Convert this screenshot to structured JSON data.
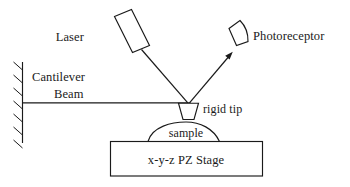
{
  "diagram": {
    "background_color": "#ffffff",
    "line_color": "#1a1a1a",
    "labels": {
      "laser": "Laser",
      "photoreceptor": "Photoreceptor",
      "cantilever_line1": "Cantilever",
      "cantilever_line2": "Beam",
      "rigid_tip": "rigid tip",
      "sample": "sample",
      "stage": "x-y-z  PZ Stage"
    },
    "components": {
      "laser_source": "laser-diode-body",
      "photodetector": "photoreceptor-body",
      "incident_beam": "incident-laser-beam",
      "reflected_beam": "reflected-laser-beam",
      "cantilever": "cantilever-beam-line",
      "fixed_support": "fixed-wall-support",
      "probe_tip": "rigid-probe-tip",
      "specimen": "sample-dome",
      "scanner": "piezo-stage-box"
    }
  }
}
